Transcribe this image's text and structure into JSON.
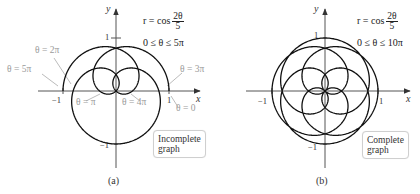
{
  "chart_data": [
    {
      "type": "line",
      "id": "a",
      "panel_label": "(a)",
      "equation": "r = cos(2θ/5)",
      "equation_lhs": "r = cos",
      "fraction_num": "2θ",
      "fraction_den": "5",
      "domain_text": "0 ≤ θ ≤ 5π",
      "theta_range": [
        0,
        5
      ],
      "theta_range_unit": "pi",
      "xlabel": "x",
      "ylabel": "y",
      "xticks": [
        {
          "value": -1,
          "label": "−1"
        },
        {
          "value": 1,
          "label": "1"
        }
      ],
      "yticks": [
        {
          "value": 1,
          "label": "1"
        },
        {
          "value": -1,
          "label": "−1"
        }
      ],
      "annotations": [
        {
          "text": "θ = 2π",
          "theta_pi": 2
        },
        {
          "text": "θ = 5π",
          "theta_pi": 5
        },
        {
          "text": "θ = 3π",
          "theta_pi": 3
        },
        {
          "text": "θ = π",
          "theta_pi": 1
        },
        {
          "text": "θ = 4π",
          "theta_pi": 4
        },
        {
          "text": "θ = 0",
          "theta_pi": 0
        }
      ],
      "note": "Incomplete graph",
      "note_line1": "Incomplete",
      "note_line2": "graph",
      "origin_px": [
        116,
        91
      ],
      "scale_px": 53
    },
    {
      "type": "line",
      "id": "b",
      "panel_label": "(b)",
      "equation": "r = cos(2θ/5)",
      "equation_lhs": "r = cos",
      "fraction_num": "2θ",
      "fraction_den": "5",
      "domain_text": "0 ≤ θ ≤ 10π",
      "theta_range": [
        0,
        10
      ],
      "theta_range_unit": "pi",
      "xlabel": "x",
      "ylabel": "y",
      "xticks": [
        {
          "value": -1,
          "label": "−1"
        },
        {
          "value": 1,
          "label": "1"
        }
      ],
      "yticks": [
        {
          "value": 1,
          "label": "1"
        },
        {
          "value": -1,
          "label": "−1"
        }
      ],
      "note": "Complete graph",
      "note_line1": "Complete",
      "note_line2": "graph",
      "origin_px": [
        325,
        91
      ],
      "scale_px": 53
    }
  ]
}
